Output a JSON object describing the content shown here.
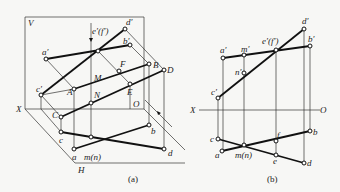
{
  "figure": {
    "panels": [
      {
        "id": "a",
        "caption": "(a)",
        "planes": {
          "V": "V",
          "H": "H"
        },
        "axis": {
          "X": "X",
          "O": "O"
        },
        "labels": {
          "a_prime": "a′",
          "b_prime": "b′",
          "c_prime": "c′",
          "d_prime": "d′",
          "ef_prime": "e′(f′)",
          "A": "A",
          "B": "B",
          "C": "C",
          "D": "D",
          "E": "E",
          "F": "F",
          "M": "M",
          "N": "N",
          "a": "a",
          "b": "b",
          "c": "c",
          "d": "d",
          "mn": "m(n)"
        }
      },
      {
        "id": "b",
        "caption": "(b)",
        "axis": {
          "X": "X",
          "O": "O"
        },
        "labels": {
          "a_prime": "a′",
          "b_prime": "b′",
          "c_prime": "c′",
          "d_prime": "d′",
          "m_prime": "m′",
          "n_prime": "n′",
          "ef_prime": "e′(f′)",
          "a": "a",
          "b": "b",
          "c": "c",
          "d": "d",
          "e": "e",
          "f": "f",
          "mn": "m(n)"
        }
      }
    ]
  }
}
